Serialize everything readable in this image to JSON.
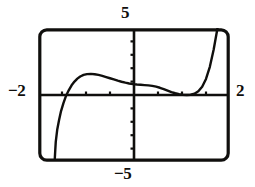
{
  "figure": {
    "kind": "graphing-calculator-screen",
    "ink_color": "#100f0d",
    "background_color": "#ffffff"
  },
  "labels": {
    "y_max": "5",
    "y_min": "−5",
    "x_min": "−2",
    "x_max": "2"
  },
  "chart_data": {
    "type": "line",
    "title": "",
    "xlabel": "",
    "ylabel": "",
    "xlim": [
      -2,
      2
    ],
    "ylim": [
      -5,
      5
    ],
    "grid": false,
    "legend": null,
    "axes": {
      "x_axis_visible": true,
      "y_axis_visible": true,
      "x_tick_interval": 0.5,
      "y_tick_interval": 1,
      "x_ticks": [
        -1.5,
        -1,
        -0.5,
        0.5,
        1,
        1.5
      ],
      "y_ticks": [
        -4,
        -3,
        -2,
        -1,
        1,
        2,
        3,
        4
      ],
      "tick_labels_shown": false
    },
    "series": [
      {
        "name": "y1",
        "x": [
          -1.65,
          -1.64,
          -1.63,
          -1.6,
          -1.56,
          -1.52,
          -1.47,
          -1.42,
          -1.36,
          -1.3,
          -1.24,
          -1.18,
          -1.12,
          -1.05,
          -0.98,
          -0.9,
          -0.82,
          -0.74,
          -0.66,
          -0.58,
          -0.5,
          -0.42,
          -0.34,
          -0.26,
          -0.18,
          -0.1,
          -0.02,
          0.06,
          0.14,
          0.22,
          0.3,
          0.38,
          0.46,
          0.54,
          0.62,
          0.7,
          0.78,
          0.86,
          0.94,
          1.02,
          1.1,
          1.18,
          1.26,
          1.34,
          1.42,
          1.5,
          1.58,
          1.66,
          1.74
        ],
        "y": [
          -4.75,
          -4.1,
          -3.5,
          -2.6,
          -1.85,
          -1.2,
          -0.6,
          -0.1,
          0.35,
          0.72,
          1.0,
          1.22,
          1.38,
          1.5,
          1.56,
          1.58,
          1.55,
          1.5,
          1.43,
          1.34,
          1.25,
          1.16,
          1.07,
          0.99,
          0.92,
          0.86,
          0.81,
          0.78,
          0.76,
          0.74,
          0.72,
          0.68,
          0.62,
          0.54,
          0.44,
          0.33,
          0.22,
          0.13,
          0.06,
          0.02,
          0.0,
          0.02,
          0.1,
          0.28,
          0.62,
          1.2,
          2.1,
          3.4,
          5.0
        ]
      }
    ],
    "notes": {
      "left_branch": "enters from bottom-left of window, rises steeply",
      "left_root": "crosses x-axis near x = -1.42",
      "local_max": "peak near x = -0.90, y = 1.58",
      "plateau": "nearly flat shoulder between x = 0.0 and x = 0.35",
      "local_min": "touches x-axis near x = 1.10, y = 0",
      "right_branch": "rises steeply, exits top of window near x = 1.74"
    }
  }
}
